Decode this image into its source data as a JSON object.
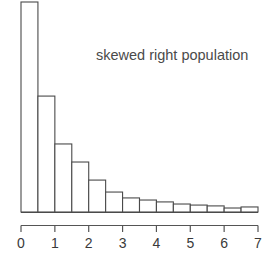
{
  "chart_data": {
    "type": "bar",
    "title": "",
    "annotation": "skewed right population",
    "xlabel": "",
    "ylabel": "",
    "xlim": [
      0,
      7
    ],
    "ylim": [
      0,
      1
    ],
    "grid": false,
    "legend": null,
    "bin_width": 0.5,
    "xticks": [
      "0",
      "1",
      "2",
      "3",
      "4",
      "5",
      "6",
      "7"
    ],
    "xtick_values": [
      0,
      1,
      2,
      3,
      4,
      5,
      6,
      7
    ],
    "bin_starts": [
      0,
      0.5,
      1.0,
      1.5,
      2.0,
      2.5,
      3.0,
      3.5,
      4.0,
      4.5,
      5.0,
      5.5,
      6.0,
      6.5
    ],
    "bin_ends": [
      0.5,
      1.0,
      1.5,
      2.0,
      2.5,
      3.0,
      3.5,
      4.0,
      4.5,
      5.0,
      5.5,
      6.0,
      6.5,
      7.0
    ],
    "values": [
      1.0,
      0.552,
      0.324,
      0.238,
      0.152,
      0.095,
      0.067,
      0.057,
      0.048,
      0.038,
      0.033,
      0.029,
      0.019,
      0.024
    ],
    "categories": [
      "0-0.5",
      "0.5-1",
      "1-1.5",
      "1.5-2",
      "2-2.5",
      "2.5-3",
      "3-3.5",
      "3.5-4",
      "4-4.5",
      "4.5-5",
      "5-5.5",
      "5.5-6",
      "6-6.5",
      "6.5-7"
    ],
    "colors": {
      "bar_fill": "#ffffff",
      "bar_stroke": "#4a4a4a",
      "axis": "#555555",
      "text": "#3a3a3a",
      "background": "#ffffff"
    }
  }
}
